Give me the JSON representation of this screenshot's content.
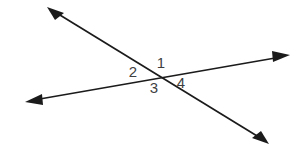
{
  "figure": {
    "title": "Two intersecting lines with four numbered angles",
    "background_color": "#ffffff",
    "line_color": "#1b1b1b",
    "label_color": "#3f3f3f",
    "canvas": {
      "width": 304,
      "height": 147
    },
    "intersection": {
      "x": 158,
      "y": 78
    },
    "lines": [
      {
        "name": "line-northwest-southeast",
        "description": "Double-headed arrow running from upper-left down to lower-right",
        "start": {
          "x": 48,
          "y": 8
        },
        "end": {
          "x": 268,
          "y": 143
        },
        "arrow_start": true,
        "arrow_end": true
      },
      {
        "name": "line-southwest-northeast",
        "description": "Double-headed arrow running from lower-left up to upper-right",
        "start": {
          "x": 26,
          "y": 101
        },
        "end": {
          "x": 289,
          "y": 55
        },
        "arrow_start": true,
        "arrow_end": true
      }
    ],
    "labels": [
      {
        "id": "angle-1",
        "text": "1",
        "x": 161,
        "y": 64,
        "position": "top"
      },
      {
        "id": "angle-2",
        "text": "2",
        "x": 133,
        "y": 73,
        "position": "left"
      },
      {
        "id": "angle-3",
        "text": "3",
        "x": 154,
        "y": 89,
        "position": "bottom"
      },
      {
        "id": "angle-4",
        "text": "4",
        "x": 181,
        "y": 84,
        "position": "right"
      }
    ]
  }
}
